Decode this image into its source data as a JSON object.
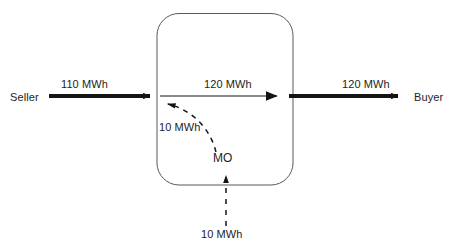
{
  "diagram": {
    "colors": {
      "line": "#141414",
      "box_border": "#595959",
      "background": "#ffffff",
      "text": "#1d1d1d"
    },
    "nodes": {
      "seller": {
        "label": "Seller",
        "icon": "seller-node"
      },
      "buyer": {
        "label": "Buyer",
        "icon": "buyer-node"
      },
      "market_operator": {
        "label": "MO",
        "icon": "market-operator-node"
      }
    },
    "flows": {
      "seller_to_system": {
        "label": "110 MWh",
        "value": 110,
        "unit": "MWh",
        "style": "solid-thick"
      },
      "system_internal": {
        "label": "120 MWh",
        "value": 120,
        "unit": "MWh",
        "style": "solid-thin"
      },
      "system_to_buyer": {
        "label": "120 MWh",
        "value": 120,
        "unit": "MWh",
        "style": "solid-thick"
      },
      "mo_adjustment": {
        "label": "10 MWh",
        "value": 10,
        "unit": "MWh",
        "style": "dashed-curved"
      },
      "mo_source": {
        "label": "10 MWh",
        "value": 10,
        "unit": "MWh",
        "style": "dashed-straight"
      }
    },
    "container": {
      "label": "",
      "shape": "rounded-rectangle"
    }
  }
}
